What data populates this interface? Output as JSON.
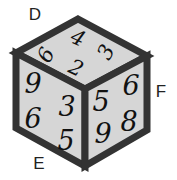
{
  "diagram": {
    "type": "isometric-cube",
    "colors": {
      "face_fill": "#d6d6d6",
      "edge": "#333333",
      "digit": "#111111",
      "label": "#222222"
    },
    "vertex_labels": {
      "D": "D",
      "E": "E",
      "F": "F"
    },
    "faces": {
      "top": {
        "digits": [
          "4",
          "6",
          "3",
          "2"
        ]
      },
      "left": {
        "digits": [
          "9",
          "3",
          "6",
          "5"
        ]
      },
      "right": {
        "digits": [
          "5",
          "6",
          "9",
          "8"
        ]
      }
    }
  }
}
